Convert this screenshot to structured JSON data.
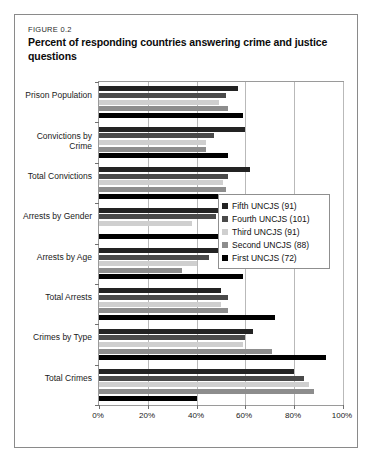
{
  "figure": {
    "label": "FIGURE 0.2",
    "title": "Percent of responding countries answering crime and justice questions"
  },
  "chart_data": {
    "type": "bar",
    "orientation": "horizontal",
    "title": "Percent of responding countries answering crime and justice questions",
    "xlabel": "",
    "ylabel": "",
    "xlim": [
      0,
      100
    ],
    "xticks": [
      "0%",
      "20%",
      "40%",
      "60%",
      "80%",
      "100%"
    ],
    "xtick_values": [
      0,
      20,
      40,
      60,
      80,
      100
    ],
    "grid": true,
    "legend_position": "center-right",
    "categories": [
      "Prison Population",
      "Convictions by Crime",
      "Total Convictions",
      "Arrests by Gender",
      "Arrests by Age",
      "Total Arrests",
      "Crimes by Type",
      "Total Crimes"
    ],
    "series": [
      {
        "name": "Fifth UNCJS (91)",
        "color": "#232323",
        "values": [
          57,
          60,
          62,
          56,
          60,
          50,
          63,
          80
        ]
      },
      {
        "name": "Fourth UNCJS (101)",
        "color": "#4a4a4a",
        "values": [
          52,
          47,
          53,
          48,
          45,
          53,
          60,
          84
        ]
      },
      {
        "name": "Third UNCJS (91)",
        "color": "#cfcfcf",
        "values": [
          49,
          44,
          51,
          38,
          40,
          50,
          59,
          86
        ]
      },
      {
        "name": "Second UNCJS (88)",
        "color": "#8d8d8d",
        "values": [
          53,
          44,
          52,
          0,
          34,
          53,
          71,
          88
        ]
      },
      {
        "name": "First UNCJS (72)",
        "color": "#000000",
        "values": [
          59,
          53,
          62,
          58,
          59,
          72,
          93,
          40
        ]
      }
    ]
  }
}
